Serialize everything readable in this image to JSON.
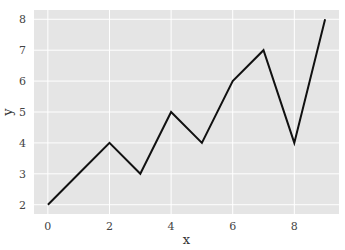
{
  "chart_data": {
    "type": "line",
    "title": "",
    "xlabel": "x",
    "ylabel": "y",
    "x": [
      0,
      1,
      2,
      3,
      4,
      5,
      6,
      7,
      8,
      9
    ],
    "series": [
      {
        "name": "y",
        "values": [
          2,
          3,
          4,
          3,
          5,
          4,
          6,
          7,
          4,
          8
        ],
        "color": "#111111"
      }
    ],
    "xticks": [
      0,
      2,
      4,
      6,
      8
    ],
    "yticks": [
      2,
      3,
      4,
      5,
      6,
      7,
      8
    ],
    "xlim": [
      -0.45,
      9.45
    ],
    "ylim": [
      1.7,
      8.3
    ],
    "grid": true,
    "legend": null,
    "style": {
      "background": "#e5e5e5",
      "grid_color": "#ffffff",
      "line_color": "#111111"
    }
  }
}
